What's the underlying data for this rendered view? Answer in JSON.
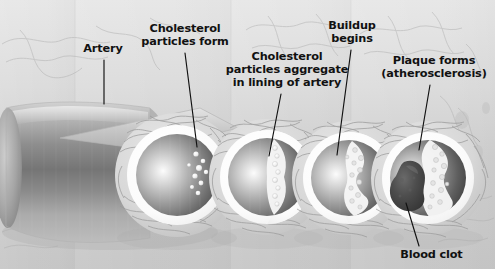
{
  "illustration": {
    "title": "Atherosclerosis progression in an artery",
    "background_color": "#cccccc",
    "ink_color": "#111111"
  },
  "labels": [
    {
      "id": "artery",
      "text": "Artery",
      "x": 73,
      "y": 42,
      "width": 60,
      "leader": {
        "x1": 104,
        "y1": 60,
        "x2": 104,
        "y2": 104
      }
    },
    {
      "id": "cholesterol-particles-form",
      "text": "Cholesterol\nparticles form",
      "x": 138,
      "y": 22,
      "width": 94,
      "leader": {
        "x1": 185,
        "y1": 53,
        "x2": 197,
        "y2": 147
      }
    },
    {
      "id": "cholesterol-particles-aggregate",
      "text": "Cholesterol\nparticles aggregate\nin lining of artery",
      "x": 224,
      "y": 50,
      "width": 126,
      "leader": {
        "x1": 281,
        "y1": 94,
        "x2": 269,
        "y2": 156
      }
    },
    {
      "id": "buildup-begins",
      "text": "Buildup\nbegins",
      "x": 322,
      "y": 19,
      "width": 60,
      "leader": {
        "x1": 351,
        "y1": 50,
        "x2": 337,
        "y2": 155
      }
    },
    {
      "id": "plaque-forms",
      "text": "Plaque forms\n(atherosclerosis)",
      "x": 378,
      "y": 54,
      "width": 112,
      "leader": {
        "x1": 430,
        "y1": 85,
        "x2": 419,
        "y2": 150
      }
    },
    {
      "id": "blood-clot",
      "text": "Blood clot",
      "x": 394,
      "y": 248,
      "width": 75,
      "leader": {
        "x1": 419,
        "y1": 246,
        "x2": 406,
        "y2": 203
      }
    }
  ],
  "artery_tube": {
    "name": "artery-cylinder",
    "description": "Longitudinal cut artery tube receding to the left"
  },
  "cross_sections": [
    {
      "id": "cross-section-1",
      "stage": "cholesterol particles form",
      "cx": 177,
      "cy": 175,
      "outer_r": 62,
      "intima_r": 50,
      "lumen_r": 41,
      "plaque": "none",
      "particles": 9,
      "clot": false
    },
    {
      "id": "cross-section-2",
      "stage": "cholesterol particles aggregate in lining of artery",
      "cx": 267,
      "cy": 177,
      "outer_r": 58,
      "intima_r": 47,
      "lumen_r": 39,
      "plaque": "slight",
      "particles": 8,
      "clot": false
    },
    {
      "id": "cross-section-3",
      "stage": "buildup begins",
      "cx": 349,
      "cy": 178,
      "outer_r": 57,
      "intima_r": 46,
      "lumen_r": 38,
      "plaque": "moderate",
      "particles": 11,
      "clot": false
    },
    {
      "id": "cross-section-4",
      "stage": "plaque forms (atherosclerosis) with blood clot",
      "cx": 428,
      "cy": 178,
      "outer_r": 57,
      "intima_r": 46,
      "lumen_r": 38,
      "plaque": "severe",
      "particles": 12,
      "clot": true
    }
  ]
}
